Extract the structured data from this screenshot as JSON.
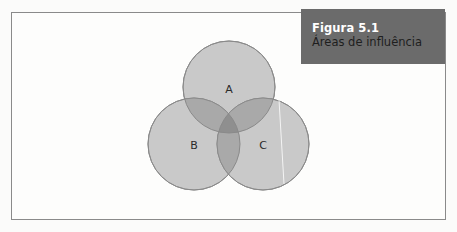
{
  "figure": {
    "number_label": "Figura 5.1",
    "title": "Áreas de influência"
  },
  "diagram": {
    "type": "venn",
    "sets": [
      {
        "label": "A",
        "cx": 229,
        "cy": 87,
        "r": 46
      },
      {
        "label": "B",
        "cx": 194,
        "cy": 144,
        "r": 46
      },
      {
        "label": "C",
        "cx": 263,
        "cy": 144,
        "r": 46
      }
    ],
    "colors": {
      "circle_fill": "#c7c7c7",
      "circle_stroke": "#8c8c8c",
      "title_box": "#6b6b6b",
      "frame": "#8a8a8a"
    }
  },
  "caption": {
    "text": ""
  }
}
